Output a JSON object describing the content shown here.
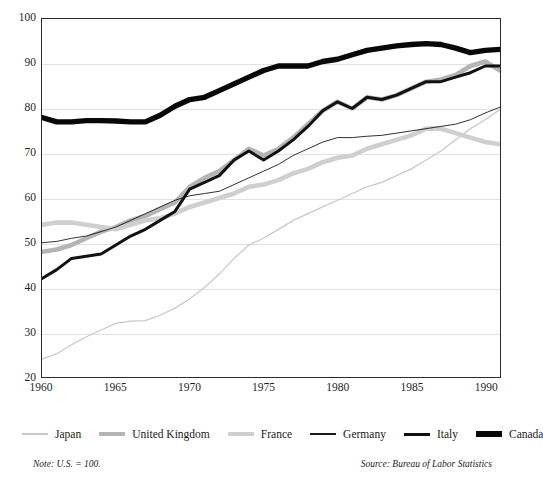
{
  "chart_data": {
    "type": "line",
    "title": "",
    "xlabel": "",
    "ylabel": "",
    "xlim": [
      1960,
      1991
    ],
    "ylim": [
      20,
      100
    ],
    "grid": true,
    "legend_position": "bottom",
    "x": [
      1960,
      1961,
      1962,
      1963,
      1964,
      1965,
      1966,
      1967,
      1968,
      1969,
      1970,
      1971,
      1972,
      1973,
      1974,
      1975,
      1976,
      1977,
      1978,
      1979,
      1980,
      1981,
      1982,
      1983,
      1984,
      1985,
      1986,
      1987,
      1988,
      1989,
      1990,
      1991
    ],
    "xticks": [
      "1960",
      "1965",
      "1970",
      "1975",
      "1980",
      "1985",
      "1990"
    ],
    "yticks": [
      "20",
      "30",
      "40",
      "50",
      "60",
      "70",
      "80",
      "90",
      "100"
    ],
    "series": [
      {
        "name": "Japan",
        "color": "#c9c9c9",
        "width": 1.3,
        "values": [
          24,
          25.2,
          27.2,
          29.0,
          30.5,
          32.0,
          32.5,
          32.6,
          33.8,
          35.4,
          37.5,
          40.0,
          43.0,
          46.5,
          49.5,
          51.0,
          53.0,
          55.0,
          56.5,
          58.0,
          59.5,
          61.0,
          62.5,
          63.5,
          65.0,
          66.5,
          68.5,
          70.5,
          73.0,
          75.5,
          77.5,
          79.8
        ]
      },
      {
        "name": "United Kingdom",
        "color": "#b4b4b4",
        "width": 4.6,
        "values": [
          48,
          48.5,
          49.5,
          51.0,
          52.5,
          53.5,
          55.0,
          56.0,
          57.5,
          59.0,
          62.5,
          64.5,
          66.0,
          68.5,
          71.0,
          69.5,
          71.0,
          73.5,
          76.5,
          79.5,
          81.5,
          80.0,
          82.5,
          82.0,
          83.0,
          84.5,
          86.0,
          86.5,
          87.5,
          89.5,
          90.5,
          88.5
        ]
      },
      {
        "name": "France",
        "color": "#cfcfcf",
        "width": 4.6,
        "values": [
          54,
          54.5,
          54.5,
          54.0,
          53.5,
          53.0,
          54.0,
          55.0,
          55.5,
          56.5,
          58.0,
          59.0,
          60.0,
          61.0,
          62.5,
          63.0,
          64.0,
          65.5,
          66.5,
          68.0,
          69.0,
          69.5,
          71.0,
          72.0,
          73.0,
          74.0,
          75.5,
          75.5,
          74.5,
          73.5,
          72.5,
          72.0
        ]
      },
      {
        "name": "Germany",
        "color": "#1a1a1a",
        "width": 0.9,
        "values": [
          50,
          50.3,
          51.0,
          51.5,
          52.5,
          53.5,
          55.0,
          56.5,
          58.0,
          59.5,
          60.5,
          61.0,
          61.5,
          63.0,
          64.5,
          66.0,
          67.5,
          69.5,
          71.0,
          72.5,
          73.5,
          73.5,
          73.8,
          74.0,
          74.5,
          75.0,
          75.5,
          76.0,
          76.5,
          77.5,
          79.0,
          80.3
        ]
      },
      {
        "name": "Italy",
        "color": "#111111",
        "width": 3.0,
        "values": [
          42,
          44.0,
          46.5,
          47.0,
          47.5,
          49.5,
          51.5,
          53.0,
          55.0,
          57.0,
          62.0,
          63.5,
          65.0,
          68.5,
          70.5,
          68.5,
          70.5,
          73.0,
          76.0,
          79.5,
          81.5,
          80.0,
          82.5,
          82.0,
          83.0,
          84.5,
          86.0,
          86.0,
          87.0,
          88.0,
          89.5,
          89.5
        ]
      },
      {
        "name": "Canada",
        "color": "#080808",
        "width": 5.4,
        "values": [
          78,
          77.0,
          77.0,
          77.3,
          77.3,
          77.2,
          77.0,
          77.0,
          78.5,
          80.5,
          82.0,
          82.5,
          84.0,
          85.5,
          87.0,
          88.5,
          89.5,
          89.5,
          89.5,
          90.5,
          91.0,
          92.0,
          93.0,
          93.5,
          94.0,
          94.3,
          94.5,
          94.3,
          93.5,
          92.5,
          93.0,
          93.2
        ]
      }
    ]
  },
  "axis": {
    "y_ticks": [
      "100",
      "90",
      "80",
      "70",
      "60",
      "50",
      "40",
      "30",
      "20"
    ],
    "x_ticks": [
      "1960",
      "1965",
      "1970",
      "1975",
      "1980",
      "1985",
      "1990"
    ]
  },
  "legend": {
    "items": [
      {
        "label": "Japan",
        "icon": "line-swatch-japan"
      },
      {
        "label": "United Kingdom",
        "icon": "line-swatch-united-kingdom"
      },
      {
        "label": "France",
        "icon": "line-swatch-france"
      },
      {
        "label": "Germany",
        "icon": "line-swatch-germany"
      },
      {
        "label": "Italy",
        "icon": "line-swatch-italy"
      },
      {
        "label": "Canada",
        "icon": "line-swatch-canada"
      }
    ]
  },
  "footnotes": {
    "note": "Note: U.S. = 100.",
    "source": "Source: Bureau of Labor Statistics"
  },
  "title_stub": ""
}
